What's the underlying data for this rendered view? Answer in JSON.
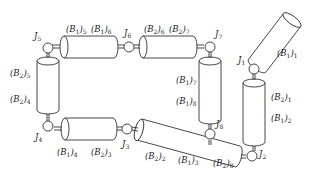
{
  "diagram": {
    "type": "modular robot chain",
    "joints": [
      "J1",
      "J2",
      "J3",
      "J4",
      "J5",
      "J6",
      "J7",
      "J8"
    ],
    "labels": {
      "j1": {
        "base": "J",
        "sub": "1"
      },
      "j2": {
        "base": "J",
        "sub": "2"
      },
      "j3": {
        "base": "J",
        "sub": "3"
      },
      "j4": {
        "base": "J",
        "sub": "4"
      },
      "j5": {
        "base": "J",
        "sub": "5"
      },
      "j6": {
        "base": "J",
        "sub": "6"
      },
      "j7": {
        "base": "J",
        "sub": "7"
      },
      "j8": {
        "base": "J",
        "sub": "8"
      },
      "b1_1": {
        "base": "(B",
        "mid": "1",
        "close": ")",
        "sub": "1"
      },
      "b2_1": {
        "base": "(B",
        "mid": "2",
        "close": ")",
        "sub": "1"
      },
      "b1_2": {
        "base": "(B",
        "mid": "1",
        "close": ")",
        "sub": "2"
      },
      "b2_2": {
        "base": "(B",
        "mid": "2",
        "close": ")",
        "sub": "2"
      },
      "b1_3": {
        "base": "(B",
        "mid": "1",
        "close": ")",
        "sub": "3"
      },
      "b2_3": {
        "base": "(B",
        "mid": "2",
        "close": ")",
        "sub": "3"
      },
      "b1_4": {
        "base": "(B",
        "mid": "1",
        "close": ")",
        "sub": "4"
      },
      "b2_4": {
        "base": "(B",
        "mid": "2",
        "close": ")",
        "sub": "4"
      },
      "b1_5": {
        "base": "(B",
        "mid": "1",
        "close": ")",
        "sub": "5"
      },
      "b2_5": {
        "base": "(B",
        "mid": "2",
        "close": ")",
        "sub": "5"
      },
      "b1_6": {
        "base": "(B",
        "mid": "1",
        "close": ")",
        "sub": "6"
      },
      "b2_6": {
        "base": "(B",
        "mid": "2",
        "close": ")",
        "sub": "6"
      },
      "b1_7": {
        "base": "(B",
        "mid": "1",
        "close": ")",
        "sub": "7"
      },
      "b2_7": {
        "base": "(B",
        "mid": "2",
        "close": ")",
        "sub": "7"
      },
      "b1_8": {
        "base": "(B",
        "mid": "1",
        "close": ")",
        "sub": "8"
      },
      "b2_8": {
        "base": "(B",
        "mid": "2",
        "close": ")",
        "sub": "8"
      }
    },
    "colors": {
      "stroke": "#333333",
      "fill": "#ffffff",
      "text": "#222222"
    }
  }
}
